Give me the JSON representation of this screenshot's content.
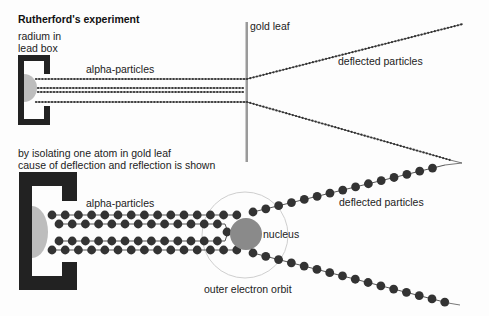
{
  "title": "Rutherford's experiment",
  "top_panel": {
    "source_label_line1": "radium in",
    "source_label_line2": "lead box",
    "beam_label": "alpha-particles",
    "foil_label": "gold leaf",
    "deflected_label": "deflected particles"
  },
  "bottom_panel": {
    "caption_line1": "by isolating one atom in gold leaf",
    "caption_line2": "cause of deflection and reflection is shown",
    "beam_label": "alpha-particles",
    "nucleus_label": "nucleus",
    "orbit_label": "outer electron orbit",
    "deflected_label": "deflected particles"
  },
  "colors": {
    "lead": "#222222",
    "radium": "#bdbdbd",
    "particle": "#333333",
    "gold_leaf": "#9a9a9a",
    "nucleus": "#8a8a8a",
    "orbit": "#cfcfcf",
    "line": "#555555"
  }
}
